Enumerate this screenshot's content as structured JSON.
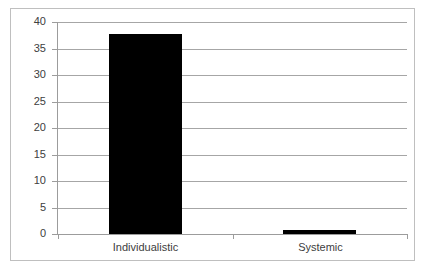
{
  "chart_data": {
    "type": "bar",
    "title": "",
    "subtitle": "",
    "xlabel": "",
    "ylabel": "",
    "categories": [
      "Individualistic",
      "Systemic"
    ],
    "values": [
      37.7,
      0.8
    ],
    "series": [
      {
        "name": "Series 1",
        "values": [
          37.7,
          0.8
        ],
        "color": "#000000"
      }
    ],
    "ylim": [
      0,
      40
    ],
    "ytick_step": 5,
    "ytick_labels": [
      "0",
      "5",
      "10",
      "15",
      "20",
      "25",
      "30",
      "35",
      "40"
    ],
    "ytick_values": [
      0,
      5,
      10,
      15,
      20,
      25,
      30,
      35,
      40
    ],
    "grid": true,
    "grid_axis": "y",
    "grid_color": "#a6a6a6",
    "axis_color": "#9c9c9c",
    "legend": false,
    "legend_position": "none",
    "plot_background": "#ffffff",
    "border_color": "#bfbfbf",
    "annotations": []
  }
}
